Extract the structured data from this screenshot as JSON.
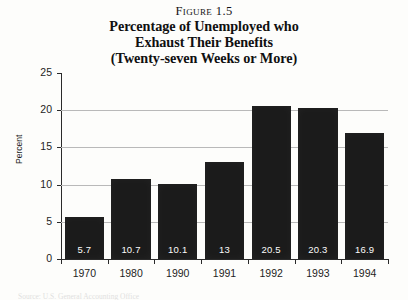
{
  "title": {
    "figure_number": "Figure 1.5",
    "lines": [
      "Percentage of Unemployed who",
      "Exhaust Their Benefits",
      "(Twenty-seven Weeks or More)"
    ]
  },
  "source_note": "Source: U.S. General Accounting Office",
  "colors": {
    "bar": "#1b1b1b",
    "gridline": "#b9b9b9",
    "axis": "#2a2a2a",
    "background": "#fdfdfb",
    "value_label": "#fbfbfb"
  },
  "chart_data": {
    "type": "bar",
    "title": "Percentage of Unemployed who Exhaust Their Benefits (Twenty-seven Weeks or More)",
    "subtitle": "Figure 1.5",
    "xlabel": "",
    "ylabel": "Percent",
    "categories": [
      "1970",
      "1980",
      "1990",
      "1991",
      "1992",
      "1993",
      "1994"
    ],
    "values": [
      5.7,
      10.7,
      10.1,
      13,
      20.5,
      20.3,
      16.9
    ],
    "value_labels": [
      "5.7",
      "10.7",
      "10.1",
      "13",
      "20.5",
      "20.3",
      "16.9"
    ],
    "ylim": [
      0,
      25
    ],
    "yticks": [
      0,
      5,
      10,
      15,
      20,
      25
    ],
    "ytick_labels": [
      "0",
      "5",
      "10",
      "15",
      "20",
      "25"
    ],
    "grid": true,
    "grid_axis": "y",
    "legend": false
  }
}
